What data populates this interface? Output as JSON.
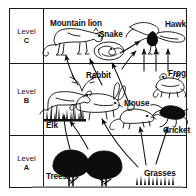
{
  "diagram": {
    "frame_color": "#1a1a1a",
    "background_color": "#ffffff",
    "ink_color": "#0d0d0d"
  },
  "levels": [
    {
      "id": "level-c",
      "word": "Level",
      "letter": "C",
      "organisms": [
        "Mountain lion",
        "Snake",
        "Hawk"
      ]
    },
    {
      "id": "level-b",
      "word": "Level",
      "letter": "B",
      "organisms": [
        "Elk",
        "Rabbit",
        "Mouse",
        "Frog",
        "Cricket"
      ]
    },
    {
      "id": "level-a",
      "word": "Level",
      "letter": "A",
      "organisms": [
        "Trees",
        "Grasses"
      ]
    }
  ],
  "organisms": {
    "mountain_lion": "Mountain lion",
    "snake": "Snake",
    "hawk": "Hawk",
    "rabbit": "Rabbit",
    "frog": "Frog",
    "mouse": "Mouse",
    "cricket": "Cricket",
    "elk": "Elk",
    "trees": "Trees",
    "grasses": "Grasses"
  },
  "icons": {
    "mountain_lion": "mountain-lion-icon",
    "snake": "snake-icon",
    "hawk": "hawk-icon",
    "rabbit": "rabbit-icon",
    "frog": "frog-icon",
    "mouse": "mouse-icon",
    "cricket": "cricket-icon",
    "elk": "elk-icon",
    "tree": "tree-icon",
    "grass": "grass-tuft-icon",
    "arrow": "energy-flow-arrow-icon"
  }
}
